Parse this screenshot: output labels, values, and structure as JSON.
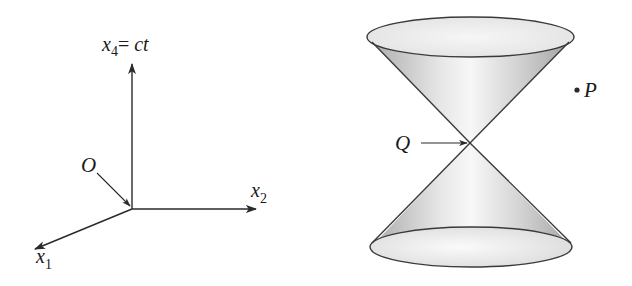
{
  "figure": {
    "left_panel": {
      "description": "Four-dimensional coordinate axes",
      "axes": [
        {
          "id": "x4",
          "label_var": "x",
          "label_sub": "4",
          "label_rest": "= ",
          "label_rest_italic": "ct"
        },
        {
          "id": "x2",
          "label_var": "x",
          "label_sub": "2"
        },
        {
          "id": "x1",
          "label_var": "x",
          "label_sub": "1"
        }
      ],
      "origin_label": "O"
    },
    "right_panel": {
      "description": "Light cone (double cone) with apex Q",
      "apex_label": "Q",
      "point_label": "P",
      "point_marker": "•"
    },
    "colors": {
      "line": "#2a2a2a",
      "cone_fill_dark": "#b8b8b8",
      "cone_fill_light": "#f4f4f4",
      "background": "#ffffff"
    }
  }
}
